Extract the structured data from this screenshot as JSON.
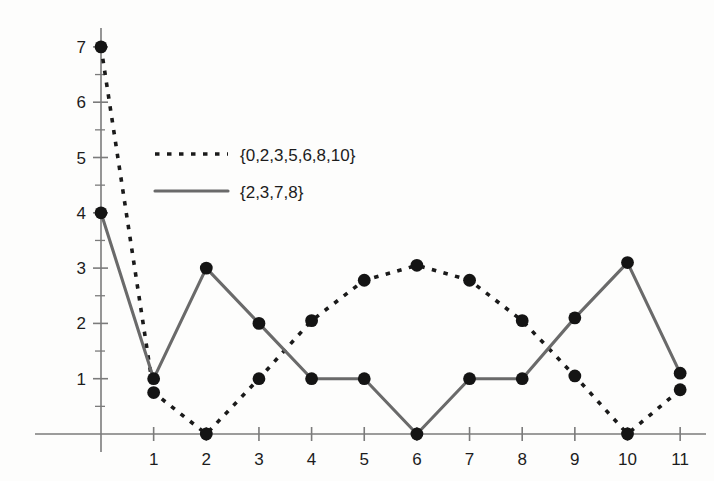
{
  "chart_data": {
    "type": "line",
    "title": "",
    "xlabel": "",
    "ylabel": "",
    "xlim": [
      0,
      11
    ],
    "ylim": [
      0,
      7
    ],
    "grid": false,
    "legend_position": "upper-left-inside",
    "x": [
      0,
      1,
      2,
      3,
      4,
      5,
      6,
      7,
      8,
      9,
      10,
      11
    ],
    "xticks": [
      "1",
      "2",
      "3",
      "4",
      "5",
      "6",
      "7",
      "8",
      "9",
      "10",
      "11"
    ],
    "xtick_values": [
      1,
      2,
      3,
      4,
      5,
      6,
      7,
      8,
      9,
      10,
      11
    ],
    "yticks": [
      "1",
      "2",
      "3",
      "4",
      "5",
      "6",
      "7"
    ],
    "ytick_values": [
      1,
      2,
      3,
      4,
      5,
      6,
      7
    ],
    "y_minor_ticks": [
      0.5,
      1.5,
      2.5,
      3.5,
      4.5,
      5.5,
      6.5
    ],
    "series": [
      {
        "name": "{0,2,3,5,6,8,10}",
        "style": "dashed",
        "color": "#1a1a1a",
        "marker": "circle",
        "values": [
          7,
          0.75,
          0,
          1,
          2.05,
          2.78,
          3.05,
          2.78,
          2.05,
          1.05,
          0,
          0.8
        ]
      },
      {
        "name": "{2,3,7,8}",
        "style": "solid",
        "color": "#6a6a6a",
        "marker": "circle",
        "values": [
          4,
          1,
          3,
          2,
          1,
          1,
          0,
          1,
          1,
          2.1,
          3.1,
          1.1
        ]
      }
    ]
  },
  "legend": {
    "entries": [
      {
        "label": "{0,2,3,5,6,8,10}",
        "style": "dashed"
      },
      {
        "label": "{2,3,7,8}",
        "style": "solid"
      }
    ]
  },
  "colors": {
    "axis": "#7b7b7b",
    "dashed_series": "#1a1a1a",
    "solid_series": "#6a6a6a",
    "marker": "#141414",
    "text": "#1c1c1c",
    "background": "#fdfdfc"
  }
}
